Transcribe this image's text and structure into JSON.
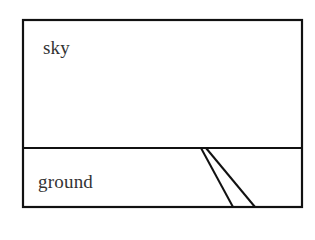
{
  "diagram": {
    "regions": [
      {
        "id": "sky",
        "label": "sky"
      },
      {
        "id": "ground",
        "label": "ground"
      }
    ],
    "colors": {
      "stroke": "#111111",
      "text": "#333333",
      "background": "#ffffff"
    },
    "frame": {
      "x1": 23,
      "y1": 20,
      "x2": 302,
      "y2": 207
    },
    "horizon_y": 148,
    "road": {
      "left_edge": {
        "x1": 201,
        "y1": 148,
        "x2": 233,
        "y2": 207
      },
      "right_edge": {
        "x1": 206,
        "y1": 148,
        "x2": 255,
        "y2": 207
      }
    }
  }
}
